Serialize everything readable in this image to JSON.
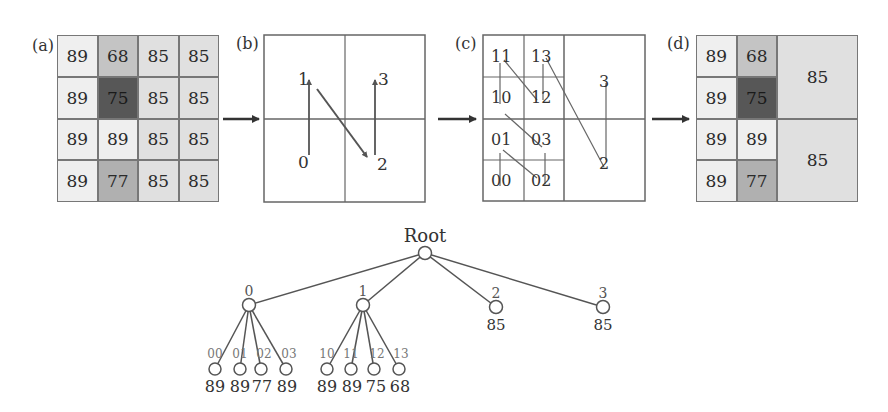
{
  "panels": {
    "a": {
      "label": "(a)",
      "cells": [
        [
          "89",
          "68",
          "85",
          "85"
        ],
        [
          "89",
          "75",
          "85",
          "85"
        ],
        [
          "89",
          "89",
          "85",
          "85"
        ],
        [
          "89",
          "77",
          "85",
          "85"
        ]
      ]
    },
    "b": {
      "label": "(b)",
      "quadrants": [
        "0",
        "1",
        "2",
        "3"
      ]
    },
    "c": {
      "label": "(c)",
      "subcells": [
        "11",
        "13",
        "10",
        "12",
        "01",
        "03",
        "00",
        "02"
      ],
      "quadrants": [
        "3",
        "2"
      ]
    },
    "d": {
      "label": "(d)",
      "left_cells": [
        [
          "89",
          "68"
        ],
        [
          "89",
          "75"
        ],
        [
          "89",
          "89"
        ],
        [
          "89",
          "77"
        ]
      ],
      "merged": [
        "85",
        "85"
      ]
    }
  },
  "colors": {
    "v89": "#efefef",
    "v85": "#e0e0e0",
    "v68": "#c4c4c4",
    "v75": "#575757",
    "v77": "#b0b0b0",
    "line": "#555555"
  },
  "tree": {
    "root": "Root",
    "level1": [
      {
        "id": "0"
      },
      {
        "id": "1"
      },
      {
        "id": "2",
        "value": "85"
      },
      {
        "id": "3",
        "value": "85"
      }
    ],
    "leaves0": [
      {
        "id": "00",
        "value": "89"
      },
      {
        "id": "01",
        "value": "89"
      },
      {
        "id": "02",
        "value": "77"
      },
      {
        "id": "03",
        "value": "89"
      }
    ],
    "leaves1": [
      {
        "id": "10",
        "value": "89"
      },
      {
        "id": "11",
        "value": "89"
      },
      {
        "id": "12",
        "value": "75"
      },
      {
        "id": "13",
        "value": "68"
      }
    ]
  }
}
